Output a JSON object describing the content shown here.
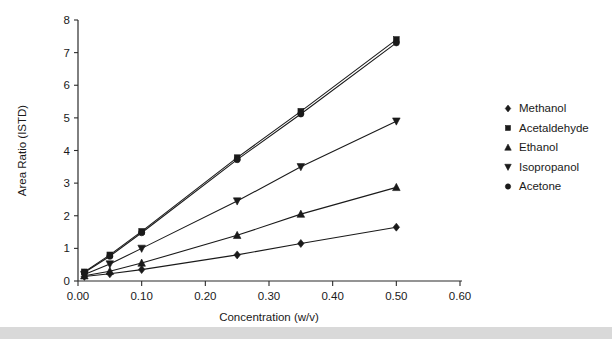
{
  "chart_data": {
    "type": "line",
    "title": "",
    "xlabel": "Concentration (w/v)",
    "ylabel": "Area Ratio (ISTD)",
    "xlim": [
      0.0,
      0.6
    ],
    "ylim": [
      0,
      8
    ],
    "xticks": [
      "0.00",
      "0.10",
      "0.20",
      "0.30",
      "0.40",
      "0.50",
      "0.60"
    ],
    "xtick_values": [
      0.0,
      0.1,
      0.2,
      0.3,
      0.4,
      0.5,
      0.6
    ],
    "yticks": [
      "0",
      "1",
      "2",
      "3",
      "4",
      "5",
      "6",
      "7",
      "8"
    ],
    "ytick_values": [
      0,
      1,
      2,
      3,
      4,
      5,
      6,
      7,
      8
    ],
    "grid": false,
    "legend_position": "right",
    "x": [
      0.01,
      0.05,
      0.1,
      0.25,
      0.35,
      0.5
    ],
    "series": [
      {
        "name": "Methanol",
        "marker": "diamond",
        "values": [
          0.14,
          0.22,
          0.35,
          0.8,
          1.15,
          1.65
        ]
      },
      {
        "name": "Acetaldehyde",
        "marker": "square",
        "values": [
          0.28,
          0.8,
          1.52,
          3.78,
          5.2,
          7.4
        ]
      },
      {
        "name": "Ethanol",
        "marker": "triangle-up",
        "values": [
          0.16,
          0.3,
          0.55,
          1.4,
          2.05,
          2.87
        ]
      },
      {
        "name": "Isopropanol",
        "marker": "triangle-down",
        "values": [
          0.2,
          0.52,
          1.0,
          2.45,
          3.5,
          4.9
        ]
      },
      {
        "name": "Acetone",
        "marker": "circle",
        "values": [
          0.26,
          0.76,
          1.48,
          3.72,
          5.12,
          7.3
        ]
      }
    ]
  },
  "legend": {
    "items": [
      {
        "label": "Methanol",
        "marker": "diamond"
      },
      {
        "label": "Acetaldehyde",
        "marker": "square"
      },
      {
        "label": "Ethanol",
        "marker": "triangle-up"
      },
      {
        "label": "Isopropanol",
        "marker": "triangle-down"
      },
      {
        "label": "Acetone",
        "marker": "circle"
      }
    ]
  },
  "colors": {
    "ink": "#1a1a1a",
    "axis": "#2b2b2b",
    "background": "#ffffff",
    "footer_bar": "#d9d9d9"
  }
}
